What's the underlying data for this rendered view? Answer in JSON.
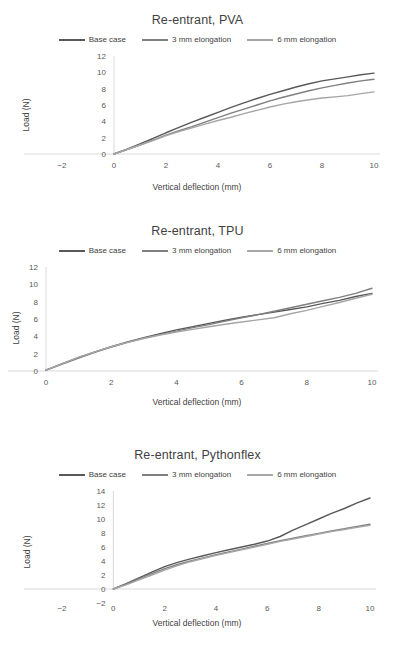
{
  "figure": {
    "series_colors": {
      "base_case": "#595959",
      "elong_3mm": "#7f7f7f",
      "elong_6mm": "#a6a6a6"
    },
    "axis_x_title": "Vertical deflection (mm)",
    "axis_y_title": "Load (N)"
  },
  "chart_data": [
    {
      "type": "line",
      "title": "Re-entrant, PVA",
      "xlabel": "Vertical deflection (mm)",
      "ylabel": "Load (N)",
      "xlim": [
        -2,
        10
      ],
      "ylim": [
        0,
        12
      ],
      "xticks": [
        -2,
        0,
        2,
        4,
        6,
        8,
        10
      ],
      "yticks": [
        0,
        2,
        4,
        6,
        8,
        10,
        12
      ],
      "grid": false,
      "legend_position": "top",
      "x": [
        0,
        0.5,
        1,
        1.5,
        2,
        2.5,
        3,
        3.5,
        4,
        4.5,
        5,
        5.5,
        6,
        6.5,
        7,
        7.5,
        8,
        8.5,
        9,
        9.5,
        10
      ],
      "series": [
        {
          "name": "Base case",
          "color": "#595959",
          "values": [
            0,
            0.6,
            1.25,
            1.9,
            2.6,
            3.25,
            3.9,
            4.5,
            5.1,
            5.7,
            6.25,
            6.8,
            7.3,
            7.75,
            8.2,
            8.6,
            8.95,
            9.2,
            9.45,
            9.7,
            9.9
          ]
        },
        {
          "name": "3 mm elongation",
          "color": "#7f7f7f",
          "values": [
            0,
            0.55,
            1.1,
            1.7,
            2.3,
            2.85,
            3.35,
            3.9,
            4.45,
            5.0,
            5.5,
            6.0,
            6.5,
            6.95,
            7.35,
            7.75,
            8.1,
            8.4,
            8.7,
            8.95,
            9.15
          ]
        },
        {
          "name": "6 mm elongation",
          "color": "#a6a6a6",
          "values": [
            0,
            0.55,
            1.1,
            1.65,
            2.25,
            2.75,
            3.2,
            3.65,
            4.1,
            4.5,
            4.95,
            5.35,
            5.75,
            6.1,
            6.4,
            6.65,
            6.85,
            7.0,
            7.15,
            7.4,
            7.6
          ]
        }
      ]
    },
    {
      "type": "line",
      "title": "Re-entrant, TPU",
      "xlabel": "Vertical deflection (mm)",
      "ylabel": "Load (N)",
      "xlim": [
        0,
        10
      ],
      "ylim": [
        0,
        12
      ],
      "xticks": [
        0,
        2,
        4,
        6,
        8,
        10
      ],
      "yticks": [
        0,
        2,
        4,
        6,
        8,
        10,
        12
      ],
      "grid": false,
      "legend_position": "top",
      "x": [
        0,
        0.5,
        1,
        1.5,
        2,
        2.5,
        3,
        3.5,
        4,
        4.5,
        5,
        5.5,
        6,
        6.5,
        7,
        7.5,
        8,
        8.5,
        9,
        9.5,
        10
      ],
      "series": [
        {
          "name": "Base case",
          "color": "#595959",
          "values": [
            0.1,
            0.85,
            1.55,
            2.2,
            2.8,
            3.35,
            3.85,
            4.3,
            4.75,
            5.1,
            5.5,
            5.85,
            6.2,
            6.5,
            6.8,
            7.1,
            7.4,
            7.8,
            8.15,
            8.6,
            8.95
          ]
        },
        {
          "name": "3 mm elongation",
          "color": "#7f7f7f",
          "values": [
            0.1,
            0.8,
            1.5,
            2.15,
            2.75,
            3.3,
            3.8,
            4.2,
            4.6,
            5.0,
            5.35,
            5.75,
            6.15,
            6.5,
            6.9,
            7.3,
            7.7,
            8.1,
            8.5,
            8.95,
            9.55
          ]
        },
        {
          "name": "6 mm elongation",
          "color": "#a6a6a6",
          "values": [
            0.1,
            0.85,
            1.6,
            2.2,
            2.8,
            3.3,
            3.75,
            4.15,
            4.5,
            4.8,
            5.1,
            5.4,
            5.65,
            5.9,
            6.15,
            6.6,
            7.0,
            7.45,
            7.9,
            8.4,
            8.85
          ]
        }
      ]
    },
    {
      "type": "line",
      "title": "Re-entrant, Pythonflex",
      "xlabel": "Vertical deflection (mm)",
      "ylabel": "Load (N)",
      "xlim": [
        -2,
        10
      ],
      "ylim": [
        -2,
        14
      ],
      "xticks": [
        -2,
        0,
        2,
        4,
        6,
        8,
        10
      ],
      "yticks": [
        -2,
        0,
        2,
        4,
        6,
        8,
        10,
        12,
        14
      ],
      "grid": false,
      "legend_position": "top",
      "x": [
        0,
        0.5,
        1,
        1.5,
        2,
        2.5,
        3,
        3.5,
        4,
        4.5,
        5,
        5.5,
        6,
        6.5,
        7,
        7.5,
        8,
        8.5,
        9,
        9.5,
        10
      ],
      "series": [
        {
          "name": "Base case",
          "color": "#595959",
          "values": [
            0,
            0.75,
            1.6,
            2.4,
            3.2,
            3.8,
            4.3,
            4.75,
            5.2,
            5.6,
            6.0,
            6.4,
            6.85,
            7.5,
            8.4,
            9.2,
            10.0,
            10.8,
            11.5,
            12.3,
            13.0
          ]
        },
        {
          "name": "3 mm elongation",
          "color": "#7f7f7f",
          "values": [
            0,
            0.7,
            1.45,
            2.2,
            2.9,
            3.5,
            4.0,
            4.45,
            4.9,
            5.3,
            5.7,
            6.1,
            6.5,
            6.9,
            7.25,
            7.6,
            7.95,
            8.3,
            8.6,
            8.95,
            9.25
          ]
        },
        {
          "name": "6 mm elongation",
          "color": "#a6a6a6",
          "values": [
            0,
            0.6,
            1.3,
            2.0,
            2.7,
            3.35,
            3.9,
            4.35,
            4.8,
            5.2,
            5.6,
            6.0,
            6.4,
            6.8,
            7.15,
            7.5,
            7.85,
            8.2,
            8.5,
            8.8,
            9.1
          ]
        }
      ]
    }
  ]
}
